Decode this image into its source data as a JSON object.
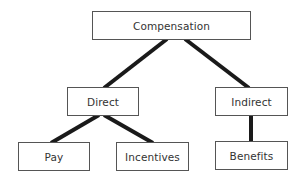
{
  "diagram": {
    "type": "hierarchy-tree",
    "root": "compensation",
    "nodes": {
      "compensation": {
        "label": "Compensation",
        "level": 0
      },
      "direct": {
        "label": "Direct",
        "level": 1
      },
      "indirect": {
        "label": "Indirect",
        "level": 1
      },
      "pay": {
        "label": "Pay",
        "level": 2
      },
      "incentives": {
        "label": "Incentives",
        "level": 2
      },
      "benefits": {
        "label": "Benefits",
        "level": 2
      }
    },
    "edges": [
      {
        "from": "compensation",
        "to": "direct"
      },
      {
        "from": "compensation",
        "to": "indirect"
      },
      {
        "from": "direct",
        "to": "pay"
      },
      {
        "from": "direct",
        "to": "incentives"
      },
      {
        "from": "indirect",
        "to": "benefits"
      }
    ],
    "colors": {
      "connector": "#1a1a1a",
      "box_border": "#555555",
      "text": "#333333",
      "background": "#ffffff"
    }
  }
}
